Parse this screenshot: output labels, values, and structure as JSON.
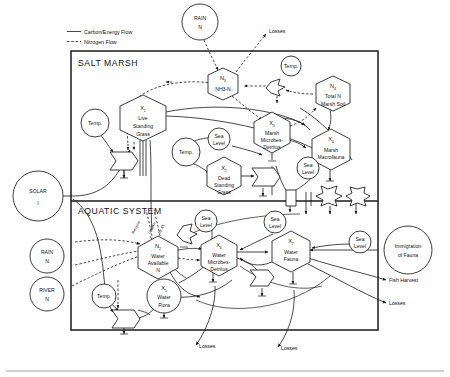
{
  "legend": {
    "carbon": "Carbon/Energy Flow",
    "nitrogen": "Nitrogen Flow"
  },
  "systems": {
    "upper": "SALT MARSH",
    "lower": "AQUATIC SYSTEM"
  },
  "sources": {
    "rain_top": {
      "l1": "RAIN",
      "l2": "N"
    },
    "solar": {
      "l1": "SOLAR",
      "l2": "I"
    },
    "rain_left": {
      "l1": "RAIN",
      "l2": "N"
    },
    "river_left": {
      "l1": "RIVER",
      "l2": "N"
    },
    "immigration": {
      "l1": "Immigration",
      "l2": "of Fauna"
    }
  },
  "sinks": {
    "losses_top": "Losses",
    "fish_harvest": "Fish Harvest",
    "losses_right": "Losses",
    "losses_bottom_left": "Losses",
    "losses_bottom_right": "Losses"
  },
  "forcings": {
    "temp": "Temp.",
    "sea_level_l1": "Sea",
    "sea_level_l2": "Level"
  },
  "annotations": {
    "recycle": "Recycle",
    "uptake": "Uptake",
    "uptake_by": "by X5"
  },
  "nodes": {
    "n3": {
      "sym": "N",
      "idx": "3",
      "l1": "NH3-N",
      "l2": "",
      "l3": ""
    },
    "n4": {
      "sym": "N",
      "idx": "4",
      "l1": "Total N",
      "l2": "Marsh Soil",
      "l3": ""
    },
    "n2": {
      "sym": "N",
      "idx": "2",
      "l1": "Water",
      "l2": "Available",
      "l3": "N"
    },
    "x1": {
      "sym": "X",
      "idx": "1",
      "l1": "Live",
      "l2": "Standing",
      "l3": "Grass"
    },
    "x2": {
      "sym": "X",
      "idx": "2",
      "l1": "Dead",
      "l2": "Standing",
      "l3": "Grass"
    },
    "x3": {
      "sym": "X",
      "idx": "3",
      "l1": "Marsh",
      "l2": "Microbes-",
      "l3": "Detritus"
    },
    "x4": {
      "sym": "X",
      "idx": "4",
      "l1": "Marsh",
      "l2": "Macrofauna",
      "l3": ""
    },
    "x5": {
      "sym": "X",
      "idx": "5",
      "l1": "Water",
      "l2": "Flora",
      "l3": ""
    },
    "x6": {
      "sym": "X",
      "idx": "6",
      "l1": "Water",
      "l2": "Microbes-",
      "l3": "Detritus"
    },
    "x7": {
      "sym": "X",
      "idx": "7",
      "l1": "Water",
      "l2": "Fauna",
      "l3": ""
    }
  },
  "colors": {
    "ink": "#1b1b1b",
    "paper": "#fefefe"
  }
}
